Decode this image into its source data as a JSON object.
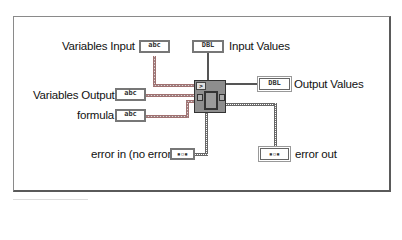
{
  "diagram": {
    "type": "labview-connector-pane",
    "node": {
      "name": "Eval Formula Node",
      "icon": "formula-node-icon"
    },
    "inputs": [
      {
        "id": "variables_input",
        "label": "Variables Input",
        "type_tag": "abc",
        "datatype": "string"
      },
      {
        "id": "input_values",
        "label": "Input Values",
        "type_tag": "DBL",
        "datatype": "double"
      },
      {
        "id": "variables_output",
        "label": "Variables Output",
        "type_tag": "abc",
        "datatype": "string"
      },
      {
        "id": "formula",
        "label": "formula",
        "type_tag": "abc",
        "datatype": "string"
      },
      {
        "id": "error_in",
        "label": "error in (no error)",
        "type_tag": "err",
        "datatype": "error cluster"
      }
    ],
    "outputs": [
      {
        "id": "output_values",
        "label": "Output Values",
        "type_tag": "DBL",
        "datatype": "double"
      },
      {
        "id": "error_out",
        "label": "error out",
        "type_tag": "err",
        "datatype": "error cluster"
      }
    ]
  },
  "colors": {
    "string_wire": "#a08a8a",
    "numeric_wire": "#555555",
    "error_wire": "#777777",
    "node_fill": "#8e8e8e",
    "frame_border": "#5a5a5a"
  }
}
